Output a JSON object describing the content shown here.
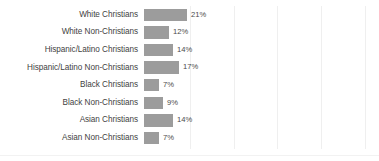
{
  "chart_data": {
    "type": "bar",
    "orientation": "horizontal",
    "title": "",
    "subtitle": "",
    "xlabel": "",
    "ylabel": "",
    "xlim": [
      0,
      25
    ],
    "grid": true,
    "gridline_values": [
      10,
      15,
      20,
      25,
      30
    ],
    "legend": null,
    "value_suffix": "%",
    "categories": [
      "White Christians",
      "White Non-Christians",
      "Hispanic/Latino Christians",
      "Hispanic/Latino Non-Christians",
      "Black Christians",
      "Black Non-Christians",
      "Asian Christians",
      "Asian Non-Christians"
    ],
    "values": [
      21,
      12,
      14,
      17,
      7,
      9,
      14,
      7
    ],
    "data_labels": [
      "21%",
      "12%",
      "14%",
      "17%",
      "7%",
      "9%",
      "14%",
      "7%"
    ],
    "bar_color": "#9c9c9c",
    "gridline_color": "#efefef",
    "label_color": "#3f3f3f"
  },
  "rows": [
    {
      "label": "White Christians",
      "value": "21%",
      "px": 43
    },
    {
      "label": "White Non-Christians",
      "value": "12%",
      "px": 25
    },
    {
      "label": "Hispanic/Latino Christians",
      "value": "14%",
      "px": 29
    },
    {
      "label": "Hispanic/Latino Non-Christians",
      "value": "17%",
      "px": 35
    },
    {
      "label": "Black Christians",
      "value": "7%",
      "px": 15
    },
    {
      "label": "Black Non-Christians",
      "value": "9%",
      "px": 19
    },
    {
      "label": "Asian Christians",
      "value": "14%",
      "px": 29
    },
    {
      "label": "Asian Non-Christians",
      "value": "7%",
      "px": 15
    }
  ],
  "gridlines_px": [
    190,
    234,
    277,
    321,
    365
  ]
}
